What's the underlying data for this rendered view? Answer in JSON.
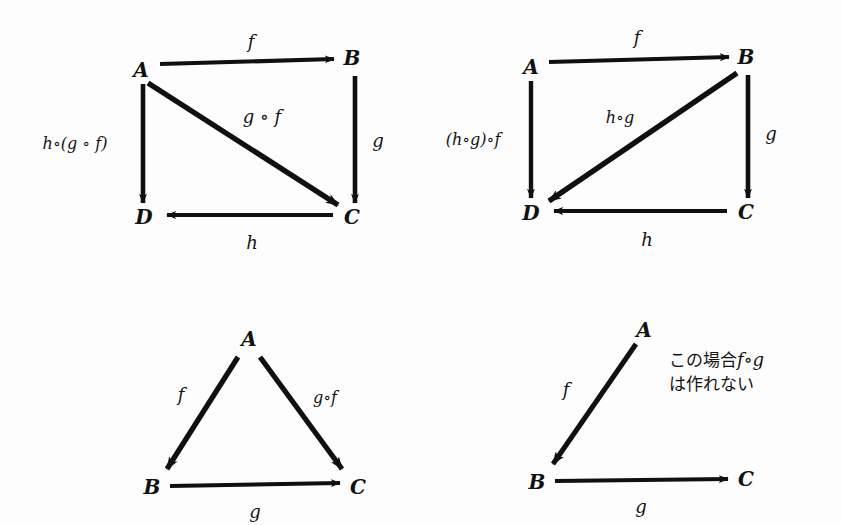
{
  "page": {
    "width": 841,
    "height": 525,
    "background": "#fdfdfd",
    "ink_color": "#101010"
  },
  "diagrams": [
    {
      "id": "top-left",
      "caption": "square-diagram-h-after-gf",
      "nodes": [
        {
          "name": "A",
          "label": "A",
          "x": 141,
          "y": 70
        },
        {
          "name": "B",
          "label": "B",
          "x": 352,
          "y": 58
        },
        {
          "name": "C",
          "label": "C",
          "x": 352,
          "y": 217
        },
        {
          "name": "D",
          "label": "D",
          "x": 144,
          "y": 217
        }
      ],
      "edges": [
        {
          "name": "f",
          "label": "f",
          "from": "A",
          "to": "B",
          "label_x": 251,
          "label_y": 42
        },
        {
          "name": "g",
          "label": "g",
          "from": "B",
          "to": "C",
          "label_x": 378,
          "label_y": 141
        },
        {
          "name": "h",
          "label": "h",
          "from": "C",
          "to": "D",
          "label_x": 252,
          "label_y": 243
        },
        {
          "name": "g-after-f",
          "label": "g ∘ f",
          "from": "A",
          "to": "C",
          "label_x": 262,
          "label_y": 117
        },
        {
          "name": "h-after-gf",
          "label": "h∘(g ∘ f)",
          "from": "A",
          "to": "D",
          "label_x": 75,
          "label_y": 144
        }
      ]
    },
    {
      "id": "top-right",
      "caption": "square-diagram-hg-after-f",
      "nodes": [
        {
          "name": "A",
          "label": "A",
          "x": 531,
          "y": 67
        },
        {
          "name": "B",
          "label": "B",
          "x": 746,
          "y": 57
        },
        {
          "name": "C",
          "label": "C",
          "x": 746,
          "y": 212
        },
        {
          "name": "D",
          "label": "D",
          "x": 531,
          "y": 213
        }
      ],
      "edges": [
        {
          "name": "f",
          "label": "f",
          "from": "A",
          "to": "B",
          "label_x": 637,
          "label_y": 38
        },
        {
          "name": "g",
          "label": "g",
          "from": "B",
          "to": "C",
          "label_x": 771,
          "label_y": 134
        },
        {
          "name": "h",
          "label": "h",
          "from": "C",
          "to": "D",
          "label_x": 647,
          "label_y": 240
        },
        {
          "name": "h-after-g",
          "label": "h∘g",
          "from": "B",
          "to": "D",
          "label_x": 620,
          "label_y": 118
        },
        {
          "name": "hg-after-f",
          "label": "(h∘g)∘f",
          "from": "A",
          "to": "D",
          "label_x": 473,
          "label_y": 140
        }
      ]
    },
    {
      "id": "bottom-left",
      "caption": "triangle-diagram-composition",
      "nodes": [
        {
          "name": "A",
          "label": "A",
          "x": 249,
          "y": 339
        },
        {
          "name": "B",
          "label": "B",
          "x": 152,
          "y": 487
        },
        {
          "name": "C",
          "label": "C",
          "x": 358,
          "y": 487
        }
      ],
      "edges": [
        {
          "name": "f",
          "label": "f",
          "from": "A",
          "to": "B",
          "label_x": 181,
          "label_y": 395
        },
        {
          "name": "g-after-f",
          "label": "g∘f",
          "from": "A",
          "to": "C",
          "label_x": 325,
          "label_y": 398
        },
        {
          "name": "g",
          "label": "g",
          "from": "B",
          "to": "C",
          "label_x": 255,
          "label_y": 512
        }
      ]
    },
    {
      "id": "bottom-right",
      "caption": "non-composable-diagram",
      "nodes": [
        {
          "name": "A",
          "label": "A",
          "x": 644,
          "y": 330
        },
        {
          "name": "B",
          "label": "B",
          "x": 537,
          "y": 482
        },
        {
          "name": "C",
          "label": "C",
          "x": 746,
          "y": 479
        }
      ],
      "edges": [
        {
          "name": "f",
          "label": "f",
          "from": "A",
          "to": "B",
          "label_x": 566,
          "label_y": 390
        },
        {
          "name": "g",
          "label": "g",
          "from": "B",
          "to": "C",
          "label_x": 641,
          "label_y": 507
        }
      ],
      "annotation": {
        "name": "japanese-note",
        "line1_prefix": "この場合",
        "line1_math": "f∘g",
        "line2": "は作れない",
        "x": 669,
        "y": 348
      }
    }
  ]
}
